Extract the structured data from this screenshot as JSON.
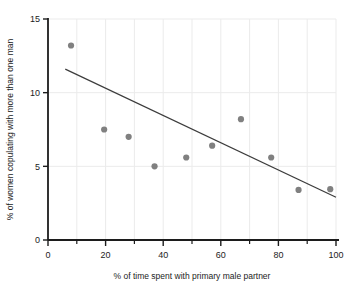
{
  "chart_data": {
    "type": "scatter",
    "title": "",
    "xlabel": "% of time spent with primary male partner",
    "ylabel": "% of women copulating with more than one man",
    "xlim": [
      0,
      100
    ],
    "ylim": [
      0,
      15
    ],
    "xticks": [
      0,
      20,
      40,
      60,
      80,
      100
    ],
    "xtick_labels": [
      "0",
      "20",
      "40",
      "60",
      "80",
      "100"
    ],
    "xminor_ticks": [
      10,
      30,
      50,
      70,
      90
    ],
    "yticks": [
      0,
      5,
      10,
      15
    ],
    "ytick_labels": [
      "0",
      "5",
      "10",
      "15"
    ],
    "grid": true,
    "grid_color": "#ebebeb",
    "legend": null,
    "marker_color": "#808080",
    "marker_size": 5,
    "line_color": "#3c3c3c",
    "x": [
      8,
      19.5,
      28,
      37,
      48,
      57,
      67,
      77.5,
      87,
      98
    ],
    "y": [
      13.2,
      7.5,
      7.0,
      5.0,
      5.6,
      6.4,
      8.2,
      5.6,
      3.4,
      3.45
    ],
    "points": [
      {
        "x": 8,
        "y": 13.2
      },
      {
        "x": 19.5,
        "y": 7.5
      },
      {
        "x": 28,
        "y": 7.0
      },
      {
        "x": 37,
        "y": 5.0
      },
      {
        "x": 48,
        "y": 5.6
      },
      {
        "x": 57,
        "y": 6.4
      },
      {
        "x": 67,
        "y": 8.2
      },
      {
        "x": 77.5,
        "y": 5.6
      },
      {
        "x": 87,
        "y": 3.4
      },
      {
        "x": 98,
        "y": 3.45
      }
    ],
    "trendline": {
      "x_start": 6,
      "y_start": 11.6,
      "x_end": 100,
      "y_end": 2.9
    }
  }
}
